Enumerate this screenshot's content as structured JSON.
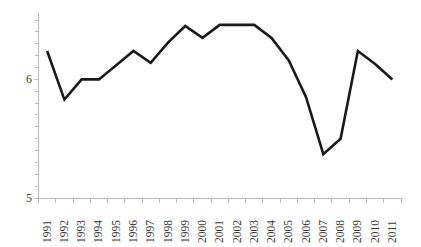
{
  "chart_data": {
    "type": "line",
    "title": "",
    "subtitle": "",
    "xlabel": "",
    "ylabel": "",
    "categories": [
      "1991",
      "1992",
      "1993",
      "1994",
      "1995",
      "1996",
      "1997",
      "1998",
      "1999",
      "2000",
      "2001",
      "2002",
      "2003",
      "2004",
      "2005",
      "2006",
      "2007",
      "2008",
      "2009",
      "2010",
      "2011"
    ],
    "values": [
      6.24,
      5.83,
      6.0,
      6.0,
      6.12,
      6.24,
      6.14,
      6.31,
      6.45,
      6.35,
      6.46,
      6.46,
      6.46,
      6.35,
      6.16,
      5.85,
      5.37,
      5.5,
      6.24,
      6.13,
      6.0
    ],
    "series": [
      {
        "name": "series-1",
        "values": [
          6.24,
          5.83,
          6.0,
          6.0,
          6.12,
          6.24,
          6.14,
          6.31,
          6.45,
          6.35,
          6.46,
          6.46,
          6.46,
          6.35,
          6.16,
          5.85,
          5.37,
          5.5,
          6.24,
          6.13,
          6.0
        ]
      }
    ],
    "ylim": [
      5,
      6.56
    ],
    "xlim": [
      0,
      20
    ],
    "y_tick_labels": [
      "6",
      "5"
    ],
    "y_tick_values": [
      6,
      5
    ],
    "y_minor_ticks": true,
    "grid": false,
    "legend": false,
    "legend_position": "none",
    "line_color": "#1a1a1a",
    "axis_color": "#b9b9b9",
    "background_color": "#ffffff",
    "x_label_rotation": "-90"
  },
  "axis": {
    "y_labels": [
      {
        "text": "6",
        "value": 6
      },
      {
        "text": "5",
        "value": 5
      }
    ],
    "x_labels": [
      {
        "text": "1991"
      },
      {
        "text": "1992"
      },
      {
        "text": "1993"
      },
      {
        "text": "1994"
      },
      {
        "text": "1995"
      },
      {
        "text": "1996"
      },
      {
        "text": "1997"
      },
      {
        "text": "1998"
      },
      {
        "text": "1999"
      },
      {
        "text": "2000"
      },
      {
        "text": "2001"
      },
      {
        "text": "2002"
      },
      {
        "text": "2003"
      },
      {
        "text": "2004"
      },
      {
        "text": "2005"
      },
      {
        "text": "2006"
      },
      {
        "text": "2007"
      },
      {
        "text": "2008"
      },
      {
        "text": "2009"
      },
      {
        "text": "2010"
      },
      {
        "text": "2011"
      }
    ]
  }
}
